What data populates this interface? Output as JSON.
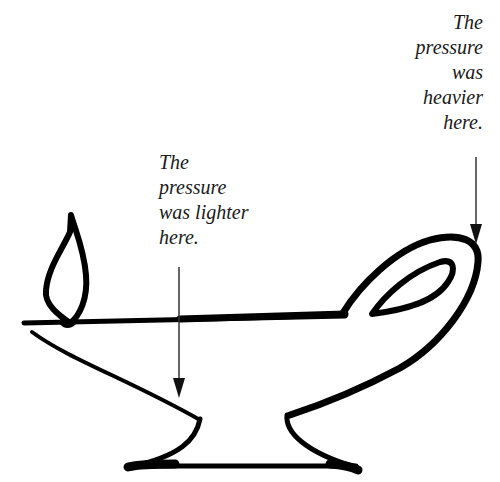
{
  "diagram": {
    "stroke_color": "#000000",
    "arrow_color": "#333333",
    "text_color": "#1a1a1a",
    "background": "#ffffff"
  },
  "annotations": {
    "heavier": {
      "lines": [
        "The",
        "pressure",
        "was",
        "heavier",
        "here."
      ]
    },
    "lighter": {
      "lines": [
        "The",
        "pressure",
        "was lighter",
        "here."
      ]
    }
  }
}
